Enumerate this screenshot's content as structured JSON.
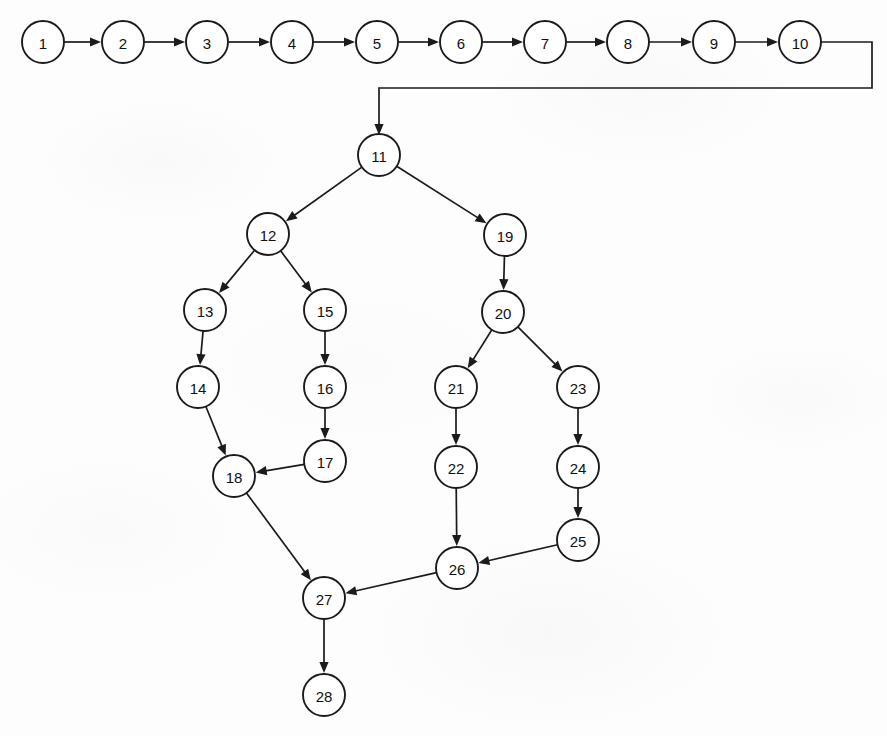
{
  "diagram": {
    "type": "directed-graph",
    "background_color": "#fdfdfd",
    "node_stroke_color": "#1b1b1b",
    "node_fill_color": "#ffffff",
    "edge_color": "#1b1b1b",
    "node_radius": 21,
    "nodes": [
      {
        "id": "1",
        "label": "1",
        "cx": 43,
        "cy": 42
      },
      {
        "id": "2",
        "label": "2",
        "cx": 123,
        "cy": 42
      },
      {
        "id": "3",
        "label": "3",
        "cx": 207,
        "cy": 42
      },
      {
        "id": "4",
        "label": "4",
        "cx": 292,
        "cy": 42
      },
      {
        "id": "5",
        "label": "5",
        "cx": 377,
        "cy": 42
      },
      {
        "id": "6",
        "label": "6",
        "cx": 461,
        "cy": 42
      },
      {
        "id": "7",
        "label": "7",
        "cx": 545,
        "cy": 42
      },
      {
        "id": "8",
        "label": "8",
        "cx": 628,
        "cy": 42
      },
      {
        "id": "9",
        "label": "9",
        "cx": 714,
        "cy": 42
      },
      {
        "id": "10",
        "label": "10",
        "cx": 800,
        "cy": 42
      },
      {
        "id": "11",
        "label": "11",
        "cx": 379,
        "cy": 155
      },
      {
        "id": "12",
        "label": "12",
        "cx": 268,
        "cy": 234
      },
      {
        "id": "13",
        "label": "13",
        "cx": 205,
        "cy": 310
      },
      {
        "id": "14",
        "label": "14",
        "cx": 198,
        "cy": 387
      },
      {
        "id": "15",
        "label": "15",
        "cx": 325,
        "cy": 310
      },
      {
        "id": "16",
        "label": "16",
        "cx": 325,
        "cy": 387
      },
      {
        "id": "17",
        "label": "17",
        "cx": 325,
        "cy": 461
      },
      {
        "id": "18",
        "label": "18",
        "cx": 234,
        "cy": 476
      },
      {
        "id": "19",
        "label": "19",
        "cx": 505,
        "cy": 235
      },
      {
        "id": "20",
        "label": "20",
        "cx": 503,
        "cy": 312
      },
      {
        "id": "21",
        "label": "21",
        "cx": 456,
        "cy": 387
      },
      {
        "id": "22",
        "label": "22",
        "cx": 456,
        "cy": 467
      },
      {
        "id": "23",
        "label": "23",
        "cx": 578,
        "cy": 387
      },
      {
        "id": "24",
        "label": "24",
        "cx": 578,
        "cy": 467
      },
      {
        "id": "25",
        "label": "25",
        "cx": 578,
        "cy": 540
      },
      {
        "id": "26",
        "label": "26",
        "cx": 457,
        "cy": 568
      },
      {
        "id": "27",
        "label": "27",
        "cx": 324,
        "cy": 598
      },
      {
        "id": "28",
        "label": "28",
        "cx": 324,
        "cy": 695
      }
    ],
    "edges": [
      {
        "from": "1",
        "to": "2",
        "kind": "straight"
      },
      {
        "from": "2",
        "to": "3",
        "kind": "straight"
      },
      {
        "from": "3",
        "to": "4",
        "kind": "straight"
      },
      {
        "from": "4",
        "to": "5",
        "kind": "straight"
      },
      {
        "from": "5",
        "to": "6",
        "kind": "straight"
      },
      {
        "from": "6",
        "to": "7",
        "kind": "straight"
      },
      {
        "from": "7",
        "to": "8",
        "kind": "straight"
      },
      {
        "from": "8",
        "to": "9",
        "kind": "straight"
      },
      {
        "from": "9",
        "to": "10",
        "kind": "straight"
      },
      {
        "from": "10",
        "to": "11",
        "kind": "orthogonal",
        "waypoints": [
          [
            872,
            42
          ],
          [
            872,
            88
          ],
          [
            379,
            88
          ]
        ]
      },
      {
        "from": "11",
        "to": "12",
        "kind": "straight"
      },
      {
        "from": "11",
        "to": "19",
        "kind": "straight"
      },
      {
        "from": "12",
        "to": "13",
        "kind": "straight"
      },
      {
        "from": "12",
        "to": "15",
        "kind": "straight"
      },
      {
        "from": "13",
        "to": "14",
        "kind": "straight"
      },
      {
        "from": "14",
        "to": "18",
        "kind": "straight"
      },
      {
        "from": "15",
        "to": "16",
        "kind": "straight"
      },
      {
        "from": "16",
        "to": "17",
        "kind": "straight"
      },
      {
        "from": "17",
        "to": "18",
        "kind": "straight"
      },
      {
        "from": "18",
        "to": "27",
        "kind": "straight"
      },
      {
        "from": "19",
        "to": "20",
        "kind": "straight"
      },
      {
        "from": "20",
        "to": "21",
        "kind": "straight"
      },
      {
        "from": "20",
        "to": "23",
        "kind": "straight"
      },
      {
        "from": "21",
        "to": "22",
        "kind": "straight"
      },
      {
        "from": "22",
        "to": "26",
        "kind": "straight"
      },
      {
        "from": "23",
        "to": "24",
        "kind": "straight"
      },
      {
        "from": "24",
        "to": "25",
        "kind": "straight"
      },
      {
        "from": "25",
        "to": "26",
        "kind": "straight"
      },
      {
        "from": "26",
        "to": "27",
        "kind": "straight"
      },
      {
        "from": "27",
        "to": "28",
        "kind": "straight"
      }
    ]
  }
}
